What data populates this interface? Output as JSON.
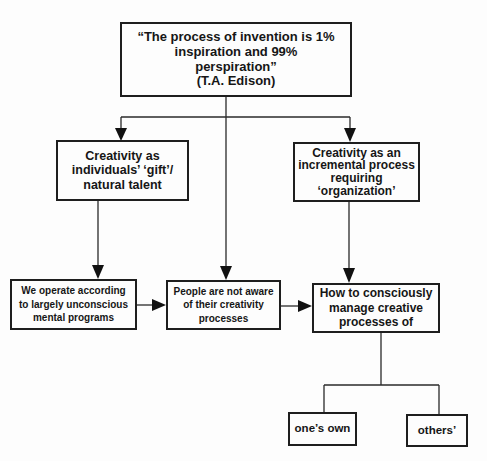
{
  "diagram": {
    "nodes": {
      "quote": {
        "text": "“The process of invention is 1%\ninspiration and 99%\nperspiration”\n(T.A. Edison)"
      },
      "gift": {
        "text": "Creativity as\nindividuals’ ‘gift’/\nnatural talent"
      },
      "incremental": {
        "text": "Creativity as an\nincremental process\nrequiring\n‘organization’"
      },
      "unconscious": {
        "text": "We operate according\nto largely unconscious\nmental programs"
      },
      "not_aware": {
        "text": "People are not aware\nof their creativity\nprocesses"
      },
      "manage": {
        "text": "How to consciously\nmanage creative\nprocesses of"
      },
      "own": {
        "text": "one’s own"
      },
      "others": {
        "text": "others’"
      }
    },
    "edges": [
      {
        "from": "quote",
        "to": "gift",
        "type": "arrow"
      },
      {
        "from": "quote",
        "to": "incremental",
        "type": "arrow"
      },
      {
        "from": "quote",
        "to": "not_aware",
        "type": "arrow"
      },
      {
        "from": "gift",
        "to": "unconscious",
        "type": "arrow"
      },
      {
        "from": "incremental",
        "to": "manage",
        "type": "arrow"
      },
      {
        "from": "unconscious",
        "to": "not_aware",
        "type": "arrow"
      },
      {
        "from": "not_aware",
        "to": "manage",
        "type": "arrow"
      },
      {
        "from": "manage",
        "to": "own",
        "type": "line"
      },
      {
        "from": "manage",
        "to": "others",
        "type": "line"
      }
    ]
  }
}
